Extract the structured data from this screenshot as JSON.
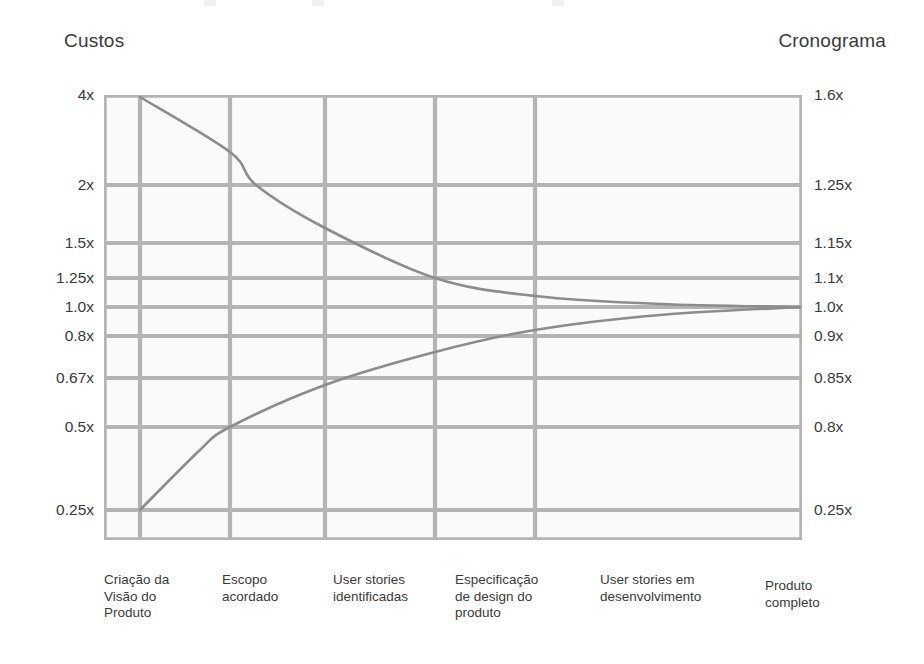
{
  "chart_data": {
    "type": "line",
    "title": "",
    "subtitle": "",
    "left_axis": {
      "label": "Custos",
      "tick_labels": [
        "4x",
        "2x",
        "1.5x",
        "1.25x",
        "1.0x",
        "0.8x",
        "0.67x",
        "0.5x",
        "0.25x"
      ],
      "tick_y": [
        95,
        185,
        243,
        278,
        307,
        336,
        378,
        427,
        510
      ]
    },
    "right_axis": {
      "label": "Cronograma",
      "tick_labels": [
        "1.6x",
        "1.25x",
        "1.15x",
        "1.1x",
        "1.0x",
        "0.9x",
        "0.85x",
        "0.8x",
        "0.25x"
      ],
      "tick_y": [
        95,
        185,
        243,
        278,
        307,
        336,
        378,
        427,
        510
      ]
    },
    "categories": [
      "Criação da Visão do Produto",
      "Escopo acordado",
      "User stories identificadas",
      "Especificação de design do produto",
      "User stories em desenvolvimento",
      "Produto completo"
    ],
    "category_x": [
      140,
      230,
      325,
      435,
      535,
      800
    ],
    "series": [
      {
        "name": "Limite superior",
        "left_values": [
          "4x",
          "2x",
          "1.5x",
          "1.25x",
          "1.1x",
          "1.0x"
        ],
        "right_values": [
          "1.6x",
          "1.25x",
          "1.15x",
          "1.1x",
          "1.05x",
          "1.0x"
        ],
        "points_px": [
          [
            140,
            97
          ],
          [
            230,
            152
          ],
          [
            256,
            185
          ],
          [
            325,
            228
          ],
          [
            435,
            278
          ],
          [
            535,
            296
          ],
          [
            660,
            304
          ],
          [
            800,
            307
          ]
        ]
      },
      {
        "name": "Limite inferior",
        "left_values": [
          "0.25x",
          "0.5x",
          "0.67x",
          "0.8x",
          "0.9x",
          "1.0x"
        ],
        "right_values": [
          "0.25x",
          "0.8x",
          "0.85x",
          "0.9x",
          "0.95x",
          "1.0x"
        ],
        "points_px": [
          [
            140,
            510
          ],
          [
            200,
            450
          ],
          [
            230,
            427
          ],
          [
            325,
            385
          ],
          [
            435,
            352
          ],
          [
            535,
            330
          ],
          [
            660,
            315
          ],
          [
            800,
            307
          ]
        ]
      }
    ],
    "grid": {
      "enabled": true,
      "color": "#b4b4b4",
      "plot_bounds": {
        "left": 104,
        "top": 95,
        "right": 802,
        "bottom": 540
      },
      "vertical_x": [
        140,
        230,
        325,
        435,
        535
      ],
      "horizontal_y": [
        185,
        243,
        278,
        307,
        336,
        378,
        427,
        510
      ]
    },
    "legend": {
      "position": "none",
      "entries": []
    },
    "line_color": "#8c8c8c",
    "background_color": "#ffffff",
    "plot_fill": "#fafafa",
    "text_color": "#3a3a3a"
  },
  "left_ticks": [
    {
      "label": "4x",
      "y": 95
    },
    {
      "label": "2x",
      "y": 185
    },
    {
      "label": "1.5x",
      "y": 243
    },
    {
      "label": "1.25x",
      "y": 278
    },
    {
      "label": "1.0x",
      "y": 307
    },
    {
      "label": "0.8x",
      "y": 336
    },
    {
      "label": "0.67x",
      "y": 378
    },
    {
      "label": "0.5x",
      "y": 427
    },
    {
      "label": "0.25x",
      "y": 510
    }
  ],
  "right_ticks": [
    {
      "label": "1.6x",
      "y": 95
    },
    {
      "label": "1.25x",
      "y": 185
    },
    {
      "label": "1.15x",
      "y": 243
    },
    {
      "label": "1.1x",
      "y": 278
    },
    {
      "label": "1.0x",
      "y": 307
    },
    {
      "label": "0.9x",
      "y": 336
    },
    {
      "label": "0.85x",
      "y": 378
    },
    {
      "label": "0.8x",
      "y": 427
    },
    {
      "label": "0.25x",
      "y": 510
    }
  ],
  "x_labels": [
    {
      "lines": [
        "Criação da",
        "Visão do",
        "Produto"
      ],
      "x": 104
    },
    {
      "lines": [
        "Escopo",
        "acordado"
      ],
      "x": 222
    },
    {
      "lines": [
        "User stories",
        "identificadas"
      ],
      "x": 333
    },
    {
      "lines": [
        "Especificação",
        "de design do",
        "produto"
      ],
      "x": 455
    },
    {
      "lines": [
        "User stories em",
        "desenvolvimento"
      ],
      "x": 600
    },
    {
      "lines": [
        "Produto",
        "completo"
      ],
      "x": 765
    }
  ],
  "axis_titles": {
    "cost": "Custos",
    "schedule": "Cronograma"
  }
}
